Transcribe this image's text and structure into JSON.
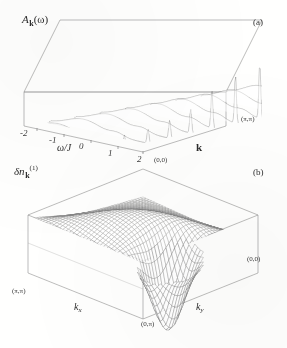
{
  "figure": {
    "background_color": "#fdfdfc",
    "ink_color": "#2b2b2b",
    "frame_color": "#8a8a8a",
    "mesh_color": "#5a5a5a"
  },
  "panels": [
    {
      "id": "a",
      "letter": "(a)",
      "zlabel": "A",
      "zlabel_sub": "k",
      "zlabel_arg": "(ω)",
      "xlabel": "ω/J",
      "xticks": [
        "-2",
        "-1",
        "0",
        "1",
        "2"
      ],
      "ylabel": "k",
      "ycorner_near": "(0,0)",
      "ycorner_far": "(π,π)"
    },
    {
      "id": "b",
      "letter": "(b)",
      "zlabel": "δn",
      "zlabel_sub": "k",
      "zlabel_sup": "(1)",
      "xlabel": "k",
      "xlabel_sub": "x",
      "ylabel": "k",
      "ylabel_sub": "y",
      "corner_left": "(π,π)",
      "corner_front": "(0,π)",
      "corner_right": "(0,0)"
    }
  ],
  "chart_data": [
    {
      "type": "line",
      "plot_style": "3d-surface-waterfall-mesh",
      "title": "",
      "panel": "a",
      "zlabel": "A_k(omega)",
      "xlabel": "omega/J",
      "ylabel": "k",
      "xlim": [
        -2.6,
        2.4
      ],
      "xticks": [
        -2,
        -1,
        0,
        1,
        2
      ],
      "ytick_labels": [
        "(0,0)",
        "(pi,pi)"
      ],
      "grid": false,
      "legend": "none",
      "description": "Waterfall of spectral function A_k(omega) traces along the momentum cut from (0,0) to (pi,pi). A tall sharp quasiparticle peak rises near omega/J ~ 0.9 at the far (pi,pi) end, a second sharp coherent peak appears near omega/J ~ 1.6 at the near (0,0) end, and a broad incoherent continuum of weight fills the range -2.4 < omega/J < 0.5.",
      "series": [
        {
          "name": "k=(0,0)",
          "peak_omega": 1.62,
          "peak_height": 0.22,
          "incoherent_weight": 0.55
        },
        {
          "name": "k=(pi/8,pi/8)",
          "peak_omega": 1.55,
          "peak_height": 0.24,
          "incoherent_weight": 0.56
        },
        {
          "name": "k=(pi/4,pi/4)",
          "peak_omega": 1.4,
          "peak_height": 0.3,
          "incoherent_weight": 0.6
        },
        {
          "name": "k=(3pi/8,3pi/8)",
          "peak_omega": 1.22,
          "peak_height": 0.4,
          "incoherent_weight": 0.64
        },
        {
          "name": "k=(pi/2,pi/2)",
          "peak_omega": 1.05,
          "peak_height": 0.62,
          "incoherent_weight": 0.7
        },
        {
          "name": "k=(5pi/8,5pi/8)",
          "peak_omega": 0.98,
          "peak_height": 0.8,
          "incoherent_weight": 0.72
        },
        {
          "name": "k=(3pi/4,3pi/4)",
          "peak_omega": 0.94,
          "peak_height": 0.92,
          "incoherent_weight": 0.74
        },
        {
          "name": "k=(7pi/8,7pi/8)",
          "peak_omega": 0.9,
          "peak_height": 0.98,
          "incoherent_weight": 0.75
        },
        {
          "name": "k=(pi,pi)",
          "peak_omega": 0.88,
          "peak_height": 1.0,
          "incoherent_weight": 0.76
        }
      ]
    },
    {
      "type": "surface",
      "plot_style": "3d-wireframe-mesh",
      "title": "",
      "panel": "b",
      "zlabel": "delta n_k^(1)",
      "xlabel": "k_x",
      "ylabel": "k_y",
      "x_corner_labels": [
        "(pi,pi)",
        "(0,pi)"
      ],
      "y_corner_labels": [
        "(0,pi)",
        "(0,0)"
      ],
      "grid": false,
      "legend": "none",
      "description": "Saddle-like first-order momentum distribution correction delta n_k^(1) over the Brillouin zone. The surface is raised and smooth toward the (pi,pi) corner, develops a broad ridge across the zone diagonal, and plunges into a deep narrow funnel-shaped minimum near the (0,pi) / (pi,0) front vertex region.",
      "zlim": [
        -1.0,
        0.45
      ],
      "features": [
        {
          "name": "ridge",
          "location": "zone diagonal",
          "value": 0.3
        },
        {
          "name": "plateau",
          "location": "(pi,pi)",
          "value": 0.18
        },
        {
          "name": "deep-minimum",
          "location": "near (0,pi)",
          "value": -0.95
        },
        {
          "name": "flat-region",
          "location": "(0,0)",
          "value": 0.05
        }
      ]
    }
  ]
}
